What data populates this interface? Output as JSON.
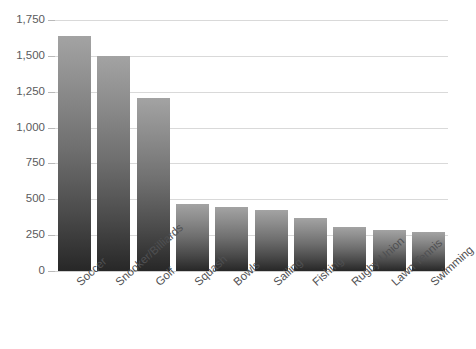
{
  "chart_data": {
    "type": "bar",
    "title": "",
    "subtitle": "",
    "xlabel": "",
    "ylabel": "",
    "categories": [
      "Soccer",
      "Snooker/Billiards",
      "Golf",
      "Squash",
      "Bowls",
      "Sailing",
      "Fishing",
      "Rugby Union",
      "Lawn Tennis",
      "Swimming"
    ],
    "values": [
      1640,
      1500,
      1205,
      465,
      445,
      425,
      370,
      305,
      285,
      275
    ],
    "ylim": [
      0,
      1750
    ],
    "ytick_values": [
      0,
      250,
      500,
      750,
      1000,
      1250,
      1500,
      1750
    ],
    "ytick_labels": [
      "0",
      "250",
      "500",
      "750",
      "1,000",
      "1,250",
      "1,500",
      "1,750"
    ],
    "grid": true,
    "legend": false,
    "legend_position": "none",
    "bar_gradient_top": "#a3a3a3",
    "bar_gradient_bottom": "#272727",
    "gridline_color": "#d9d9d9",
    "axis_text_color": "#58595b",
    "background_color": "#ffffff"
  }
}
